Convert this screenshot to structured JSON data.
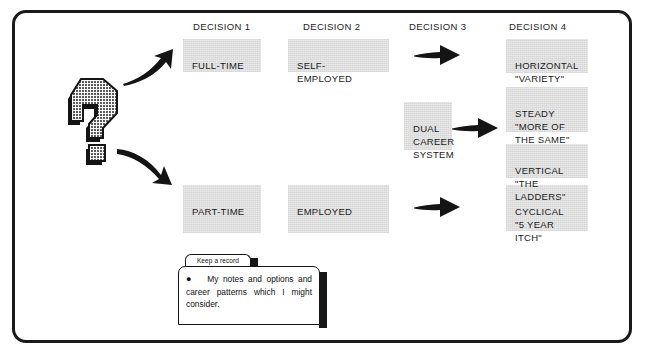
{
  "diagram": {
    "title_frame": "career decision flow chart",
    "column_headers": [
      {
        "label": "DECISION 1",
        "x": 190,
        "y": 18
      },
      {
        "label": "DECISION 2",
        "x": 300,
        "y": 18
      },
      {
        "label": "DECISION 3",
        "x": 406,
        "y": 18
      },
      {
        "label": "DECISION 4",
        "x": 506,
        "y": 18
      }
    ],
    "boxes": [
      {
        "name": "full-time",
        "text": "FULL-TIME",
        "x": 180,
        "y": 36,
        "w": 78,
        "h": 33
      },
      {
        "name": "self-employed",
        "text": "SELF-EMPLOYED",
        "x": 285,
        "y": 36,
        "w": 101,
        "h": 33
      },
      {
        "name": "dual-career-system",
        "text": "DUAL\nCAREER\nSYSTEM",
        "x": 401,
        "y": 99,
        "w": 48,
        "h": 48
      },
      {
        "name": "horizontal-variety",
        "text": "HORIZONTAL\n\"VARIETY\"",
        "x": 503,
        "y": 36,
        "w": 82,
        "h": 34
      },
      {
        "name": "steady-more-of-the-same",
        "text": "STEADY\n\"MORE OF\nTHE SAME\"",
        "x": 503,
        "y": 84,
        "w": 82,
        "h": 45
      },
      {
        "name": "vertical-the-ladders",
        "text": "VERTICAL\n\"THE LADDERS\"",
        "x": 503,
        "y": 141,
        "w": 82,
        "h": 34
      },
      {
        "name": "part-time",
        "text": "PART-TIME",
        "x": 180,
        "y": 182,
        "w": 78,
        "h": 48
      },
      {
        "name": "employed",
        "text": "EMPLOYED",
        "x": 285,
        "y": 182,
        "w": 101,
        "h": 48
      },
      {
        "name": "cyclical-5-year-itch",
        "text": "CYCLICAL\n\"5 YEAR\nITCH\"",
        "x": 503,
        "y": 182,
        "w": 82,
        "h": 46
      }
    ],
    "arrows": [
      {
        "name": "curved-arrow-up",
        "kind": "curve-up"
      },
      {
        "name": "curved-arrow-down",
        "kind": "curve-down"
      },
      {
        "name": "straight-arrow-decision3-top",
        "kind": "straight"
      },
      {
        "name": "straight-arrow-dual-career",
        "kind": "straight"
      },
      {
        "name": "straight-arrow-decision3-bottom",
        "kind": "straight"
      }
    ],
    "question_mark": {
      "name": "question-mark-graphic",
      "glyph": "?"
    },
    "note": {
      "tab_label": "Keep a record",
      "bullet": "●",
      "body": "My notes and options and career patterns which I might consider."
    },
    "colors": {
      "box_fill": "#e9e9e9",
      "ink": "#1a1a1a",
      "frame": "#1a1a1a",
      "paper": "#ffffff"
    }
  }
}
